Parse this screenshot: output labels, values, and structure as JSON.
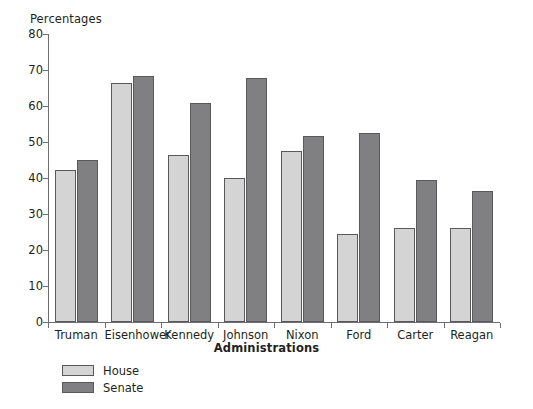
{
  "chart_data": {
    "type": "bar",
    "title": "",
    "xlabel": "Administrations",
    "ylabel": "Percentages",
    "ylim": [
      0,
      80
    ],
    "yticks": [
      0,
      10,
      20,
      30,
      40,
      50,
      60,
      70,
      80
    ],
    "grid": false,
    "legend_position": "bottom-left",
    "categories": [
      "Truman",
      "Eisenhower",
      "Kennedy",
      "Johnson",
      "Nixon",
      "Ford",
      "Carter",
      "Reagan"
    ],
    "series": [
      {
        "name": "House",
        "color": "#d4d4d4",
        "values": [
          42.2,
          66.4,
          46.4,
          40.0,
          47.4,
          24.5,
          26.2,
          26.2
        ]
      },
      {
        "name": "Senate",
        "color": "#808083",
        "values": [
          45.0,
          68.2,
          60.9,
          67.8,
          51.6,
          52.5,
          39.4,
          36.3
        ]
      }
    ]
  },
  "legend": {
    "items": [
      {
        "label": "House"
      },
      {
        "label": "Senate"
      }
    ]
  },
  "colors": {
    "house": "#d4d4d4",
    "senate": "#808083",
    "axis": "#6d6e71",
    "bar_border": "#58595b",
    "text": "#231f20",
    "background": "#ffffff"
  }
}
